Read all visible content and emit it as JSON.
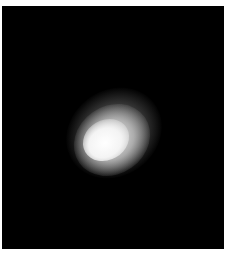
{
  "image": {
    "description": "blurred bright elliptical blob on black background",
    "background_color": "#000000",
    "border_color": "#ffffff",
    "blob": {
      "center_approx": [
        100,
        140
      ],
      "core_color": "#ffffff",
      "orientation": "diagonal, lower-left to upper-right"
    }
  }
}
